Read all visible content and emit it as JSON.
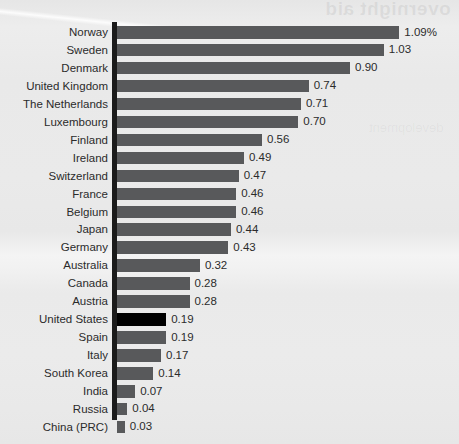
{
  "artifacts": {
    "bleed_through_top": "overnight aid",
    "bleed_through_mid": "development"
  },
  "chart_data": {
    "type": "bar",
    "orientation": "horizontal",
    "title": "",
    "subtitle": "",
    "xlabel": "",
    "ylabel": "",
    "grid": false,
    "legend": false,
    "value_suffix_first": "%",
    "xlim": [
      0,
      1.09
    ],
    "highlight_category": "United States",
    "highlight_color": "#000000",
    "bar_color": "#58595b",
    "axis_color": "#1b1b1b",
    "text_color": "#2b2b2b",
    "background_color": "#eaeaea",
    "categories": [
      "Norway",
      "Sweden",
      "Denmark",
      "United Kingdom",
      "The Netherlands",
      "Luxembourg",
      "Finland",
      "Ireland",
      "Switzerland",
      "France",
      "Belgium",
      "Japan",
      "Germany",
      "Australia",
      "Canada",
      "Austria",
      "United States",
      "Spain",
      "Italy",
      "South Korea",
      "India",
      "Russia",
      "China (PRC)"
    ],
    "values": [
      1.09,
      1.03,
      0.9,
      0.74,
      0.71,
      0.7,
      0.56,
      0.49,
      0.47,
      0.46,
      0.46,
      0.44,
      0.43,
      0.32,
      0.28,
      0.28,
      0.19,
      0.19,
      0.17,
      0.14,
      0.07,
      0.04,
      0.03
    ],
    "value_labels": [
      "1.09%",
      "1.03",
      "0.90",
      "0.74",
      "0.71",
      "0.70",
      "0.56",
      "0.49",
      "0.47",
      "0.46",
      "0.46",
      "0.44",
      "0.43",
      "0.32",
      "0.28",
      "0.28",
      "0.19",
      "0.19",
      "0.17",
      "0.14",
      "0.07",
      "0.04",
      "0.03"
    ]
  }
}
